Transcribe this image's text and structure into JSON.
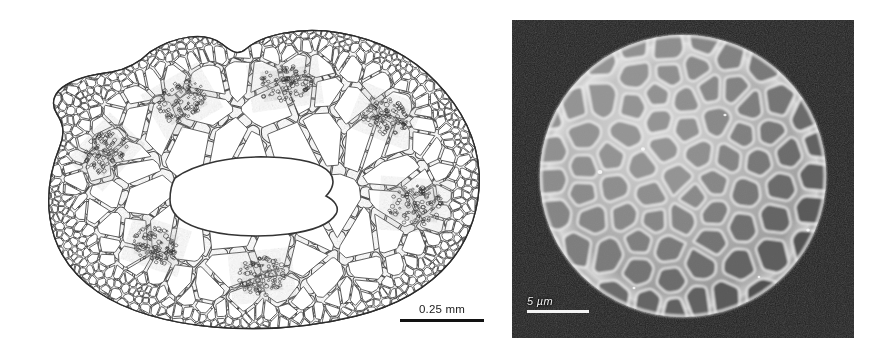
{
  "figure": {
    "background_color": "#ffffff",
    "panel_count": 2
  },
  "panels": [
    {
      "id": "left",
      "kind": "light-micrograph-line-drawing",
      "subject": "plant stem transverse section",
      "description": "Stippled line drawing of a transverse section through a stem showing epidermis, cortical parenchyma, a ring of vascular bundles and a central lacuna",
      "scalebar": {
        "label": "0.25 mm",
        "value": 0.25,
        "unit": "mm",
        "bar_color": "#121212",
        "text_color": "#1b1b1b",
        "position": "bottom-right"
      },
      "features": {
        "central_cavity": "lacuna",
        "vascular_bundle_count": 7,
        "outline_color": "#3a3a3a",
        "cell_fill": "#ffffff"
      }
    },
    {
      "id": "right",
      "kind": "scanning-electron-micrograph",
      "subject": "spherical verrucate body",
      "description": "SEM of a near-spherical body whose surface is covered by tightly packed polygonal verrucae separated by bright ridges",
      "scalebar": {
        "label": "5 µm",
        "value": 5,
        "unit": "µm",
        "bar_color": "#f4f4f4",
        "text_color": "#f2f2f2",
        "position": "bottom-left"
      },
      "features": {
        "background_color": "#0a0a0a",
        "cell_fill": "#8a8a8a",
        "ridge_color": "#e8e8e8",
        "verrucae_count": 96
      }
    }
  ]
}
